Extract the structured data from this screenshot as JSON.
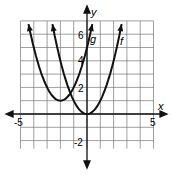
{
  "chart_data": {
    "type": "line",
    "title": "",
    "xlabel": "x",
    "ylabel": "y",
    "xlim": [
      -5,
      5
    ],
    "ylim": [
      -3,
      7
    ],
    "grid": true,
    "tick_labels": {
      "x": [
        "-5",
        "5"
      ],
      "y": [
        "6",
        "4",
        "2",
        "-2"
      ]
    },
    "series": [
      {
        "name": "f",
        "equation": "y = x^2",
        "vertex": [
          0,
          0
        ],
        "x": [
          -2.6,
          -2,
          -1,
          0,
          1,
          2,
          2.6
        ],
        "y": [
          6.8,
          4,
          1,
          0,
          1,
          4,
          6.8
        ]
      },
      {
        "name": "g",
        "equation": "y = (x+2)^2 + 1",
        "vertex": [
          -2,
          1
        ],
        "x": [
          -4.4,
          -4,
          -3,
          -2,
          -1,
          0,
          0.4
        ],
        "y": [
          6.8,
          5,
          2,
          1,
          2,
          5,
          6.8
        ]
      }
    ]
  },
  "labels": {
    "x_axis": "x",
    "y_axis": "y",
    "f": "f",
    "g": "g",
    "x_min": "-5",
    "x_max": "5",
    "y6": "6",
    "y4": "4",
    "y2": "2",
    "yneg2": "-2"
  }
}
